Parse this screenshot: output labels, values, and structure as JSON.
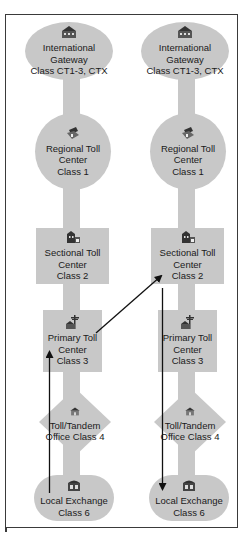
{
  "diagram": {
    "title": "",
    "colors": {
      "node_fill": "#c8c8c8",
      "frame": "#3a3a3a",
      "arrow": "#111111",
      "text": "#1a1a1a"
    },
    "columns": [
      {
        "nodes": [
          {
            "id": "intl",
            "shape": "ellipse",
            "icon": "building-icon",
            "label": "International Gateway\nClass CT1-3, CTX"
          },
          {
            "id": "regional",
            "shape": "circle",
            "icon": "regional-office-icon",
            "label": "Regional Toll\nCenter\nClass 1"
          },
          {
            "id": "sectional",
            "shape": "square",
            "icon": "sectional-office-icon",
            "label": "Sectional Toll\nCenter\nClass 2"
          },
          {
            "id": "primary",
            "shape": "square",
            "icon": "antenna-building-icon",
            "label": "Primary Toll\nCenter\nClass 3"
          },
          {
            "id": "tandem",
            "shape": "diamond",
            "icon": "house-icon",
            "label": "Toll/Tandem\nOffice\nClass 4"
          },
          {
            "id": "local",
            "shape": "rounded-rect",
            "icon": "exchange-building-icon",
            "label": "Local Exchange\nClass 6"
          }
        ]
      },
      {
        "nodes": [
          {
            "id": "intl",
            "shape": "ellipse",
            "icon": "building-icon",
            "label": "International Gateway\nClass CT1-3, CTX"
          },
          {
            "id": "regional",
            "shape": "circle",
            "icon": "regional-office-icon",
            "label": "Regional Toll\nCenter\nClass 1"
          },
          {
            "id": "sectional",
            "shape": "square",
            "icon": "sectional-office-icon",
            "label": "Sectional Toll\nCenter\nClass 2"
          },
          {
            "id": "primary",
            "shape": "square",
            "icon": "antenna-building-icon",
            "label": "Primary Toll\nCenter\nClass 3"
          },
          {
            "id": "tandem",
            "shape": "diamond",
            "icon": "house-icon",
            "label": "Toll/Tandem\nOffice\nClass 4"
          },
          {
            "id": "local",
            "shape": "rounded-rect",
            "icon": "exchange-building-icon",
            "label": "Local Exchange\nClass 6"
          }
        ]
      }
    ],
    "call_path": [
      {
        "from": "left.local",
        "to": "left.primary",
        "direction": "up"
      },
      {
        "from": "left.primary",
        "to": "right.sectional",
        "direction": "diagonal-up"
      },
      {
        "from": "right.sectional",
        "to": "right.local",
        "direction": "down"
      }
    ]
  }
}
